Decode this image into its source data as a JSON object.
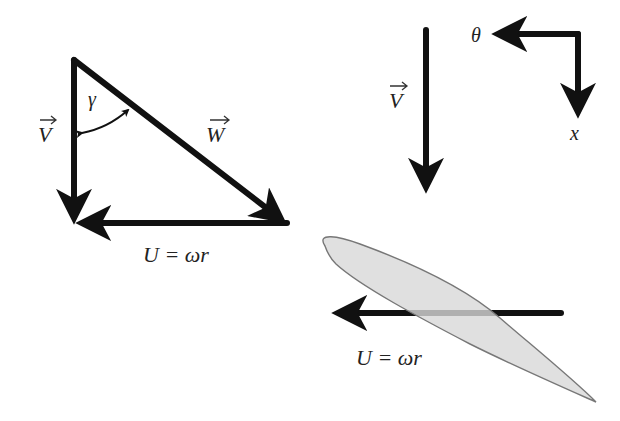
{
  "colors": {
    "arrow": "#111111",
    "airfoil_fill": "#dcdcdc",
    "airfoil_stroke": "#777777",
    "text": "#222222",
    "background": "#ffffff"
  },
  "triangle": {
    "labels": {
      "V": "V",
      "W": "W",
      "gamma": "γ",
      "U": "U = ωr"
    }
  },
  "axis_view": {
    "labels": {
      "V": "V",
      "theta": "θ",
      "x": "x"
    }
  },
  "airfoil": {
    "labels": {
      "U": "U = ωr"
    }
  }
}
